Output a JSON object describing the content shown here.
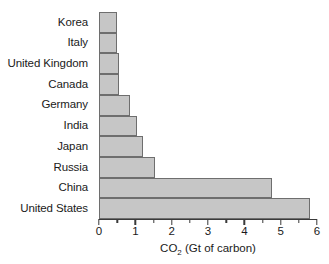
{
  "chart_data": {
    "type": "bar",
    "orientation": "horizontal",
    "title": "",
    "xlabel": "CO2 (Gt of carbon)",
    "xlabel_parts": {
      "prefix": "CO",
      "subscript": "2",
      "suffix": " (Gt of carbon)"
    },
    "ylabel": "",
    "categories": [
      "Korea",
      "Italy",
      "United Kingdom",
      "Canada",
      "Germany",
      "India",
      "Japan",
      "Russia",
      "China",
      "United States"
    ],
    "values": [
      0.5,
      0.5,
      0.55,
      0.55,
      0.85,
      1.05,
      1.2,
      1.55,
      4.75,
      5.8
    ],
    "xlim": [
      0,
      6
    ],
    "x_major_ticks": [
      0,
      1,
      2,
      3,
      4,
      5,
      6
    ],
    "x_minor_ticks": [
      0.5,
      1.5,
      2.5,
      3.5,
      4.5,
      5.5
    ],
    "x_tick_labels": [
      "0",
      "1",
      "2",
      "3",
      "4",
      "5",
      "6"
    ],
    "grid": false,
    "legend": null,
    "bar_fill_color": "#c6c6c6",
    "bar_edge_color": "#6e6e6e",
    "axis_color": "#3a3a3a"
  }
}
